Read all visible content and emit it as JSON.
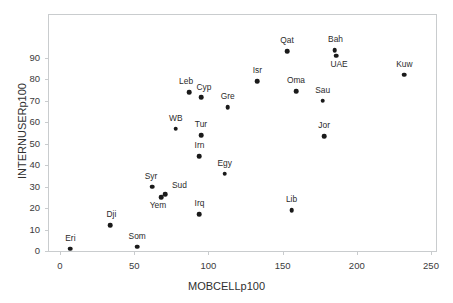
{
  "chart_data": {
    "type": "scatter",
    "title": "",
    "xlabel": "MOBCELLp100",
    "ylabel": "INTERNUSERp100",
    "xlim": [
      0,
      250
    ],
    "ylim": [
      0,
      95
    ],
    "xticks": [
      0,
      50,
      100,
      150,
      200,
      250
    ],
    "yticks": [
      0,
      10,
      20,
      30,
      40,
      50,
      60,
      70,
      80,
      90
    ],
    "grid": false,
    "legend": false,
    "point_color": "#1a1a1a",
    "frame_color": "#c9ccce",
    "points": [
      {
        "label": "Eri",
        "x": 7,
        "y": 1,
        "dx": 0,
        "dy": -15
      },
      {
        "label": "Som",
        "x": 52,
        "y": 2,
        "dx": 0,
        "dy": -15
      },
      {
        "label": "Dji",
        "x": 34,
        "y": 12,
        "dx": 1,
        "dy": -15
      },
      {
        "label": "Irq",
        "x": 94,
        "y": 17,
        "dx": 0,
        "dy": -15
      },
      {
        "label": "Lib",
        "x": 156,
        "y": 19,
        "dx": 0,
        "dy": -15
      },
      {
        "label": "Yem",
        "x": 68,
        "y": 25,
        "dx": -3,
        "dy": 4
      },
      {
        "label": "Sud",
        "x": 71,
        "y": 26.5,
        "dx": 14,
        "dy": -13
      },
      {
        "label": "Syr",
        "x": 62,
        "y": 30,
        "dx": -1,
        "dy": -15
      },
      {
        "label": "Egy",
        "x": 111,
        "y": 36,
        "dx": 0,
        "dy": -15
      },
      {
        "label": "Irn",
        "x": 94,
        "y": 44,
        "dx": 0,
        "dy": -15
      },
      {
        "label": "Jor",
        "x": 178,
        "y": 53.5,
        "dx": 0,
        "dy": -15
      },
      {
        "label": "Tur",
        "x": 95,
        "y": 54,
        "dx": 0,
        "dy": -15
      },
      {
        "label": "WB",
        "x": 78,
        "y": 57,
        "dx": 0,
        "dy": -15
      },
      {
        "label": "Gre",
        "x": 113,
        "y": 67,
        "dx": 0,
        "dy": -15
      },
      {
        "label": "Sau",
        "x": 177,
        "y": 70,
        "dx": 0,
        "dy": -15
      },
      {
        "label": "Cyp",
        "x": 95,
        "y": 71.5,
        "dx": 3,
        "dy": -14
      },
      {
        "label": "Leb",
        "x": 87,
        "y": 74,
        "dx": -3,
        "dy": -15
      },
      {
        "label": "Oma",
        "x": 159,
        "y": 74.5,
        "dx": 0,
        "dy": -15
      },
      {
        "label": "Isr",
        "x": 133,
        "y": 79,
        "dx": 0,
        "dy": -15
      },
      {
        "label": "Kuw",
        "x": 232,
        "y": 82,
        "dx": 0,
        "dy": -15
      },
      {
        "label": "UAE",
        "x": 186,
        "y": 91,
        "dx": 3,
        "dy": 4
      },
      {
        "label": "Bah",
        "x": 185,
        "y": 93.5,
        "dx": 1,
        "dy": -15
      },
      {
        "label": "Qat",
        "x": 153,
        "y": 93,
        "dx": 0,
        "dy": -15
      }
    ]
  }
}
